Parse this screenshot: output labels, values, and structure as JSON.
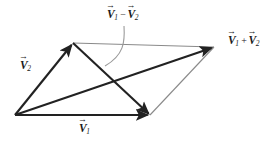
{
  "figure": {
    "background_color": "#ffffff",
    "vector_color": "#222222",
    "guide_color": "#8a8a8a",
    "leader_color": "#9a9a9a",
    "width": 267,
    "height": 150
  },
  "labels": {
    "v1": {
      "symbol": "V",
      "arrow": "→",
      "subscript": "1",
      "operator": "",
      "symbol2": "",
      "subscript2": "",
      "text": "V⃗1"
    },
    "v2": {
      "symbol": "V",
      "arrow": "→",
      "subscript": "2",
      "operator": "",
      "symbol2": "",
      "subscript2": "",
      "text": "V⃗2"
    },
    "sum": {
      "symbol": "V",
      "arrow": "→",
      "subscript": "1",
      "operator": "+",
      "symbol2": "V",
      "subscript2": "2",
      "text": "V⃗1 + V⃗2"
    },
    "difference": {
      "symbol": "V",
      "arrow": "→",
      "subscript": "1",
      "operator": "−",
      "symbol2": "V",
      "subscript2": "2",
      "text": "V⃗1 − V⃗2"
    }
  },
  "geometry": {
    "origin": {
      "x": 15,
      "y": 115
    },
    "tip_v2": {
      "x": 73,
      "y": 43
    },
    "tip_v1": {
      "x": 150,
      "y": 115
    },
    "tip_sum": {
      "x": 214,
      "y": 47
    },
    "vectors": [
      {
        "name": "V1",
        "from": [
          15,
          115
        ],
        "to": [
          150,
          115
        ],
        "style": "thick-arrow"
      },
      {
        "name": "V2",
        "from": [
          15,
          115
        ],
        "to": [
          73,
          43
        ],
        "style": "thick-arrow"
      },
      {
        "name": "V1+V2",
        "from": [
          15,
          115
        ],
        "to": [
          214,
          47
        ],
        "style": "thick-arrow"
      },
      {
        "name": "V1-V2",
        "from": [
          73,
          43
        ],
        "to": [
          150,
          115
        ],
        "style": "thick-arrow"
      }
    ],
    "guides": [
      {
        "name": "top-edge",
        "from": [
          73,
          43
        ],
        "to": [
          214,
          47
        ]
      },
      {
        "name": "right-edge",
        "from": [
          150,
          115
        ],
        "to": [
          214,
          47
        ]
      }
    ],
    "leader": {
      "name": "difference-leader",
      "from": [
        124,
        26
      ],
      "to": [
        105,
        66
      ]
    }
  }
}
